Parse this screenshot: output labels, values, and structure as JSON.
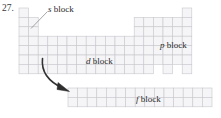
{
  "figure": {
    "problem_number": "27.",
    "kind": "periodic-table-block-diagram",
    "labels": {
      "s_block": {
        "italic": "s",
        "rest": " block"
      },
      "p_block": {
        "italic": "p",
        "rest": " block"
      },
      "d_block": {
        "italic": "d",
        "rest": " block"
      },
      "f_block": {
        "italic": "f",
        "rest": " block"
      }
    },
    "colors": {
      "grid_line": "#c9c9cf",
      "grid_fill": "#f4f4f6",
      "text": "#2b2b2b",
      "leader_line": "#8a8a90",
      "arrow": "#2f2f2f",
      "background": "#ffffff"
    },
    "geometry": {
      "cell_width": 9.6,
      "cell_height": 9.4,
      "main_table_left": 19,
      "main_table_top": 8,
      "f_block_left": 68,
      "f_block_top": 88,
      "f_block_cols": 15,
      "f_block_rows": 2,
      "s_block_cols": 2,
      "p_block_cols": 6,
      "d_block_cols": 10,
      "main_rows": 7
    },
    "annotations": {
      "s_leader": "diagonal line from s block label down-left to top s-block cells",
      "d_to_f_arrow": "curved arrow from d block region down-right to f block"
    }
  }
}
